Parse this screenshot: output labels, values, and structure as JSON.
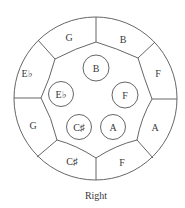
{
  "caption": "Right",
  "colors": {
    "line": "#555555",
    "text": "#3a3a3a",
    "background": "#ffffff"
  },
  "outer_ring": [
    {
      "id": "outer-top-left",
      "note": "G",
      "natural": "G",
      "accidental": ""
    },
    {
      "id": "outer-top-right",
      "note": "B",
      "natural": "B",
      "accidental": ""
    },
    {
      "id": "outer-right-upper",
      "note": "F",
      "natural": "F",
      "accidental": ""
    },
    {
      "id": "outer-right-lower",
      "note": "A",
      "natural": "A",
      "accidental": ""
    },
    {
      "id": "outer-bottom-right",
      "note": "F",
      "natural": "F",
      "accidental": ""
    },
    {
      "id": "outer-bottom-left",
      "note": "C♯",
      "natural": "C",
      "accidental": "♯"
    },
    {
      "id": "outer-left-lower",
      "note": "G",
      "natural": "G",
      "accidental": ""
    },
    {
      "id": "outer-left-upper",
      "note": "E♭",
      "natural": "E",
      "accidental": "♭"
    }
  ],
  "inner_notes": [
    {
      "id": "inner-top",
      "note": "B",
      "natural": "B",
      "accidental": ""
    },
    {
      "id": "inner-left",
      "note": "E♭",
      "natural": "E",
      "accidental": "♭"
    },
    {
      "id": "inner-right",
      "note": "F",
      "natural": "F",
      "accidental": ""
    },
    {
      "id": "inner-bottom-left",
      "note": "C♯",
      "natural": "C",
      "accidental": "♯"
    },
    {
      "id": "inner-bottom-right",
      "note": "A",
      "natural": "A",
      "accidental": ""
    }
  ]
}
